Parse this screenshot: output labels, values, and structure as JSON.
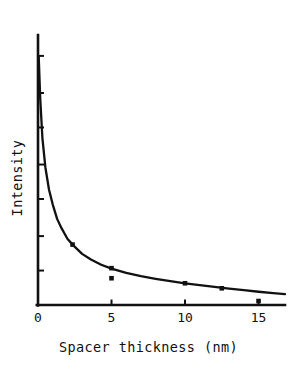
{
  "chart_data": {
    "type": "line",
    "title": "",
    "xlabel": "Spacer thickness (nm)",
    "ylabel": "Intensity",
    "xlim": [
      0,
      16.8
    ],
    "ylim": [
      0,
      1.0
    ],
    "grid": false,
    "legend": null,
    "xticks": [
      0,
      5,
      10,
      15
    ],
    "xticklabels": [
      "0",
      "5",
      "10",
      "15"
    ],
    "yticks": [
      0.13,
      0.26,
      0.4,
      0.53,
      0.67,
      0.8,
      0.94
    ],
    "yticklabels": [
      "",
      "",
      "",
      "",
      "",
      "",
      ""
    ],
    "series": [
      {
        "name": "fit curve",
        "type": "line",
        "x": [
          0.05,
          0.15,
          0.3,
          0.5,
          0.75,
          1.0,
          1.3,
          1.6,
          2.0,
          2.4,
          3.0,
          3.6,
          4.3,
          5.0,
          6.0,
          7.0,
          8.0,
          9.0,
          10.0,
          11.0,
          12.0,
          13.0,
          14.0,
          15.0,
          16.0,
          16.8
        ],
        "y": [
          0.935,
          0.78,
          0.63,
          0.52,
          0.435,
          0.38,
          0.325,
          0.29,
          0.25,
          0.225,
          0.193,
          0.172,
          0.152,
          0.137,
          0.121,
          0.109,
          0.099,
          0.09,
          0.082,
          0.075,
          0.068,
          0.062,
          0.056,
          0.05,
          0.045,
          0.041
        ]
      },
      {
        "name": "measured points",
        "type": "scatter",
        "x": [
          2.35,
          5.0,
          5.0,
          10.0,
          12.5,
          15.0
        ],
        "y": [
          0.228,
          0.139,
          0.101,
          0.082,
          0.063,
          0.015
        ]
      }
    ]
  },
  "axes": {
    "axis_color": "#111111",
    "curve_color": "#111111",
    "marker_color": "#111111"
  }
}
